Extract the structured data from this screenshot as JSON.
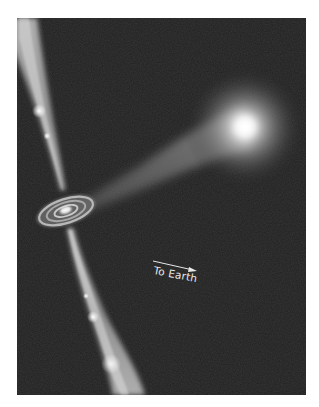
{
  "illustration": {
    "subject": "binary star system with accretion disk and relativistic jets",
    "elements": {
      "companion_star": "bright glowing star",
      "accretion_stream": "gas stream from star to disk",
      "accretion_disk": "spiral disk around compact object",
      "jets": "bipolar jets with bright knots"
    },
    "annotation": {
      "label": "To Earth",
      "arrow": "direction-arrow"
    },
    "colors": {
      "background": "#202020",
      "page": "#ffffff",
      "glow": "#ffffff"
    }
  }
}
